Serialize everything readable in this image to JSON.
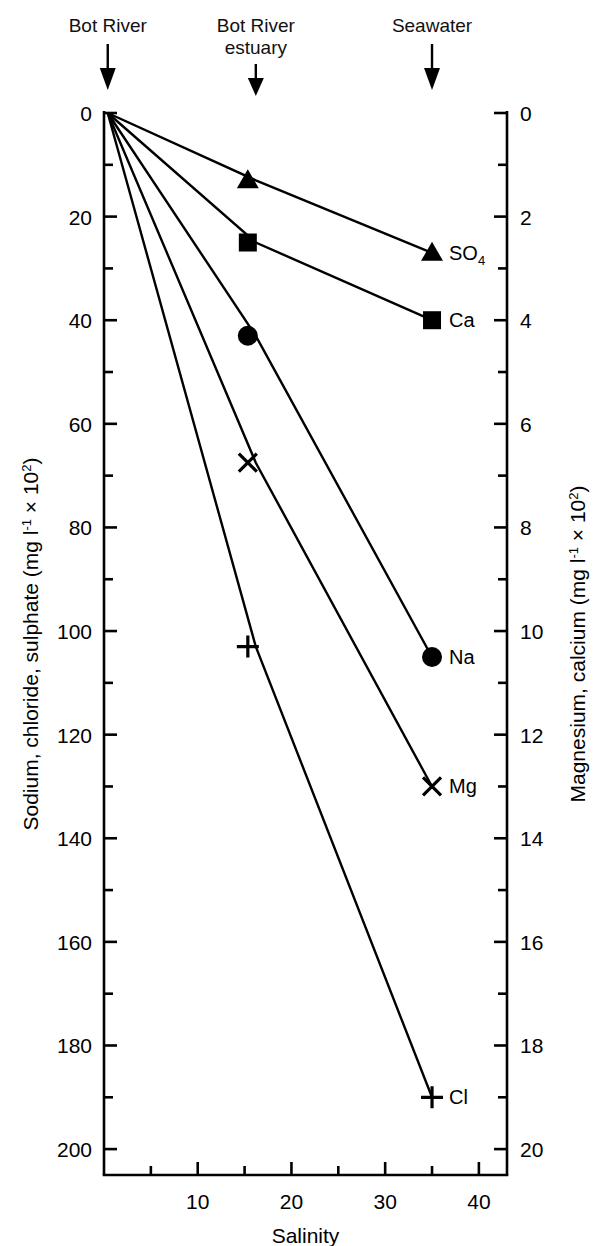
{
  "chart_data": {
    "type": "line",
    "title": "",
    "xlabel": "Salinity",
    "ylabel": "Sodium, chloride, sulphate (mg l⁻¹ × 10²)",
    "ylabel_right": "Magnesium, calcium (mg l⁻¹ × 10²)",
    "xlim": [
      0,
      43
    ],
    "ylim_left": [
      0,
      205
    ],
    "ylim_right": [
      0,
      20.5
    ],
    "y_inverted": true,
    "grid": false,
    "legend": "inline-endpoint-labels",
    "x_ticks": [
      10,
      20,
      30,
      40
    ],
    "x_tick_labels": [
      "10",
      "20",
      "30",
      "40"
    ],
    "x_minor_ticks": [
      5,
      15,
      25,
      35
    ],
    "y_ticks_left": [
      0,
      20,
      40,
      60,
      80,
      100,
      120,
      140,
      160,
      180,
      200
    ],
    "y_tick_labels_left": [
      "0",
      "20",
      "40",
      "60",
      "80",
      "100",
      "120",
      "140",
      "160",
      "180",
      "200"
    ],
    "y_minor_ticks_left": [
      10,
      30,
      50,
      70,
      90,
      110,
      130,
      150,
      170,
      190
    ],
    "y_ticks_right": [
      0,
      2,
      4,
      6,
      8,
      10,
      12,
      14,
      16,
      18,
      20
    ],
    "y_tick_labels_right": [
      "0",
      "2",
      "4",
      "6",
      "8",
      "10",
      "12",
      "14",
      "16",
      "18",
      "20"
    ],
    "y_minor_ticks_right": [
      1,
      3,
      5,
      7,
      9,
      11,
      13,
      15,
      17,
      19
    ],
    "series": [
      {
        "name": "SO4",
        "label": "SO",
        "label_sub": "4",
        "axis": "left",
        "marker": "triangle",
        "x": [
          0.4,
          16.2,
          35
        ],
        "values": [
          0,
          13,
          27
        ]
      },
      {
        "name": "Ca",
        "label": "Ca",
        "axis": "right",
        "marker": "square",
        "x": [
          0.4,
          16.2,
          35
        ],
        "values": [
          0,
          2.5,
          4.0
        ],
        "values_left_equivalent": [
          0,
          25,
          40
        ]
      },
      {
        "name": "Na",
        "label": "Na",
        "axis": "left",
        "marker": "circle",
        "x": [
          0.4,
          16.2,
          35
        ],
        "values": [
          0,
          43,
          105
        ]
      },
      {
        "name": "Mg",
        "label": "Mg",
        "axis": "right",
        "marker": "cross-x",
        "x": [
          0.4,
          16.2,
          35
        ],
        "values": [
          0,
          6.75,
          13
        ],
        "values_left_equivalent": [
          0,
          67.5,
          130
        ]
      },
      {
        "name": "Cl",
        "label": "Cl",
        "axis": "left",
        "marker": "plus",
        "x": [
          0.4,
          16.2,
          35
        ],
        "values": [
          0,
          103,
          190
        ]
      }
    ],
    "annotations": [
      {
        "name": "bot-river",
        "text_line1": "Bot River",
        "text_line2": "",
        "x_value": 0.4,
        "arrow": "down"
      },
      {
        "name": "bot-river-estuary",
        "text_line1": "Bot River",
        "text_line2": "estuary",
        "x_value": 16.2,
        "arrow": "down"
      },
      {
        "name": "seawater",
        "text_line1": "Seawater",
        "text_line2": "",
        "x_value": 35,
        "arrow": "down"
      }
    ]
  },
  "style": {
    "ink": "#000000",
    "background": "#ffffff"
  }
}
